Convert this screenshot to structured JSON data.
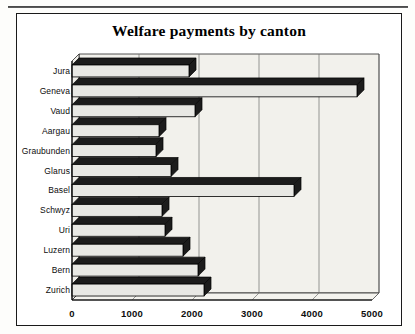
{
  "figure": {
    "title": "Welfare payments by canton"
  },
  "chart_data": {
    "type": "bar",
    "orientation": "horizontal",
    "style": "3d-bar",
    "title": "Welfare payments by canton",
    "xlabel": "",
    "ylabel": "",
    "categories": [
      "Jura",
      "Geneva",
      "Vaud",
      "Aargau",
      "Graubunden",
      "Glarus",
      "Basel",
      "Schwyz",
      "Uri",
      "Luzern",
      "Bern",
      "Zurich"
    ],
    "values": [
      1950,
      4750,
      2050,
      1450,
      1400,
      1650,
      3700,
      1500,
      1550,
      1850,
      2100,
      2200
    ],
    "xticks": [
      0,
      1000,
      2000,
      3000,
      4000,
      5000
    ],
    "xtick_labels": [
      "0",
      "1000",
      "2000",
      "3000",
      "4000",
      "5000"
    ],
    "xlim": [
      0,
      5000
    ],
    "grid": true,
    "grid_axis": "x",
    "legend": false,
    "bar_fill": "#e8e8e4",
    "bar_edge": "#000000",
    "bar_side": "#1c1c1c",
    "plot_background": "#f2f1ec"
  }
}
